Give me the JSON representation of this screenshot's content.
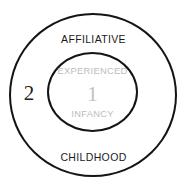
{
  "diagram": {
    "type": "concentric-rings",
    "background_color": "#ffffff",
    "stroke_color": "#141414",
    "rings": [
      {
        "index": 1,
        "number_label": "1",
        "number_color": "#c2c2c2",
        "top_label": "EXPERIENCED",
        "bottom_label": "INFANCY",
        "label_color": "#bcbcbc"
      },
      {
        "index": 2,
        "number_label": "2",
        "number_color": "#222222",
        "top_label": "AFFILIATIVE",
        "bottom_label": "CHILDHOOD",
        "label_color": "#1b1b1b"
      }
    ]
  }
}
